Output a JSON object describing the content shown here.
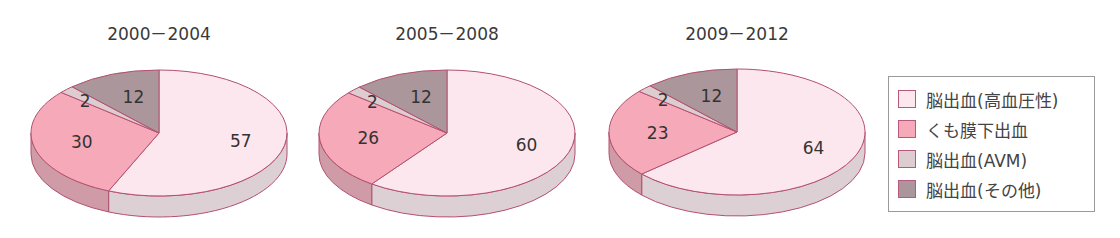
{
  "chart_data": {
    "type": "pie",
    "style": "3d",
    "legend_position": "right",
    "categories": [
      "脳出血(高血圧性)",
      "くも膜下出血",
      "脳出血(AVM)",
      "脳出血(その他)"
    ],
    "colors": {
      "top": [
        "#fde7ee",
        "#f6a9b8",
        "#ddccd0",
        "#ab979b"
      ],
      "side": [
        "#ddd0d4",
        "#cf9ba7",
        "#c9b9bd",
        "#958286"
      ],
      "outline": "#b4506f"
    },
    "charts": [
      {
        "title": "2000－2004",
        "values": [
          57,
          30,
          2,
          12
        ]
      },
      {
        "title": "2005－2008",
        "values": [
          60,
          26,
          2,
          12
        ]
      },
      {
        "title": "2009－2012",
        "values": [
          64,
          23,
          2,
          12
        ]
      }
    ]
  },
  "legend": {
    "items": [
      {
        "label": "脳出血(高血圧性)"
      },
      {
        "label": "くも膜下出血"
      },
      {
        "label": "脳出血(AVM)"
      },
      {
        "label": "脳出血(その他)"
      }
    ]
  }
}
